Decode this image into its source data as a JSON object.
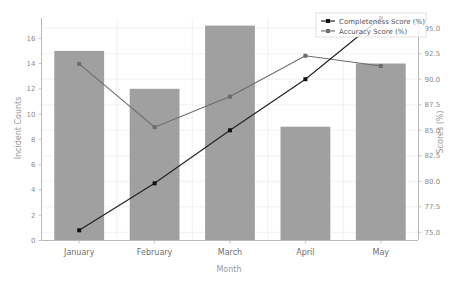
{
  "chart_data": {
    "type": "bar",
    "title": "",
    "subtitle": "",
    "xlabel": "Month",
    "ylabel": "Incident Counts",
    "y2label": "Scores (%)",
    "categories": [
      "January",
      "February",
      "March",
      "April",
      "May"
    ],
    "grid": true,
    "legend_position": "top-right",
    "ylim": [
      0,
      17.6
    ],
    "y2lim": [
      74.2,
      96.0
    ],
    "yticks": [
      "0",
      "2",
      "4",
      "6",
      "8",
      "10",
      "12",
      "14",
      "16"
    ],
    "ytick_values": [
      0,
      2,
      4,
      6,
      8,
      10,
      12,
      14,
      16
    ],
    "y2ticks": [
      "75.0",
      "77.5",
      "80.0",
      "82.5",
      "85.0",
      "87.5",
      "90.0",
      "92.5",
      "95.0"
    ],
    "y2tick_values": [
      75.0,
      77.5,
      80.0,
      82.5,
      85.0,
      87.5,
      90.0,
      92.5,
      95.0
    ],
    "bars": {
      "name": "Incident Counts",
      "values": [
        15,
        12,
        17,
        9,
        14
      ],
      "color": "#a0a0a0",
      "axis": "left"
    },
    "series": [
      {
        "name": "Completeness Score (%)",
        "values": [
          75.2,
          79.8,
          85.0,
          90.0,
          96.0
        ],
        "color": "#111111",
        "marker": "square",
        "axis": "right"
      },
      {
        "name": "Accuracy Score (%)",
        "values": [
          91.5,
          85.3,
          88.3,
          92.3,
          91.3
        ],
        "color": "#6b6b6b",
        "marker": "square",
        "axis": "right"
      }
    ]
  },
  "legend": {
    "entries": [
      {
        "label": "Completeness Score (%)"
      },
      {
        "label": "Accuracy Score (%)"
      }
    ]
  }
}
